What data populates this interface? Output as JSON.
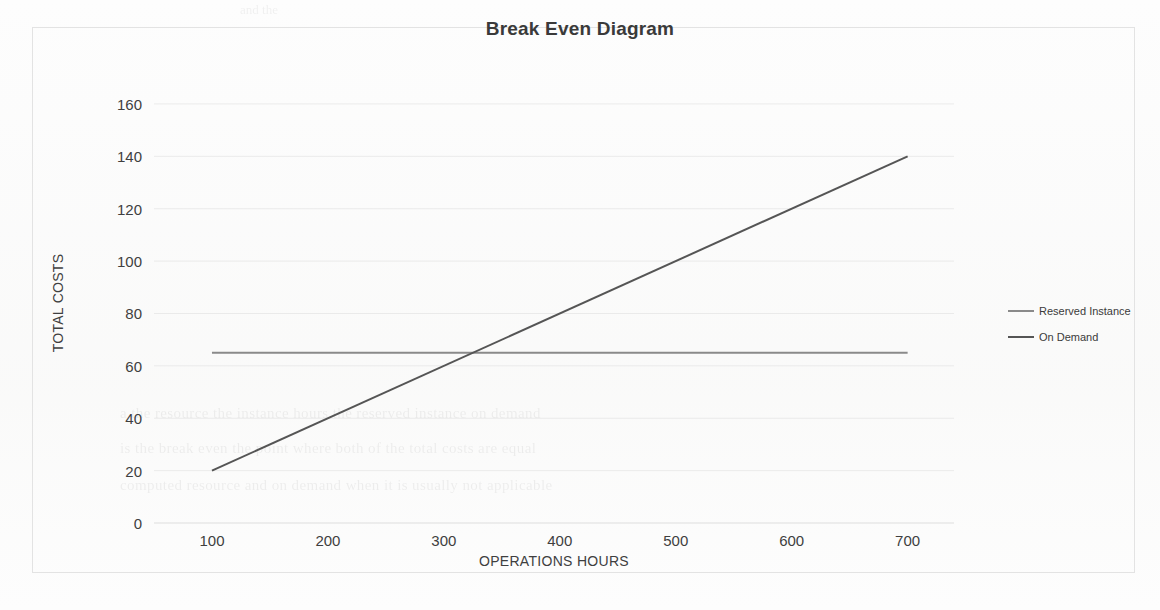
{
  "chart_data": {
    "type": "line",
    "title": "Break Even Diagram",
    "xlabel": "OPERATIONS HOURS",
    "ylabel": "TOTAL COSTS",
    "xlim": [
      50,
      740
    ],
    "ylim": [
      0,
      168
    ],
    "xticks": [
      100,
      200,
      300,
      400,
      500,
      600,
      700
    ],
    "yticks": [
      0,
      20,
      40,
      60,
      80,
      100,
      120,
      140,
      160
    ],
    "grid": true,
    "legend_position": "right",
    "series": [
      {
        "name": "Reserved Instance",
        "color": "#8a8a8a",
        "x": [
          100,
          700
        ],
        "values": [
          65,
          65
        ]
      },
      {
        "name": "On Demand",
        "color": "#555555",
        "x": [
          100,
          700
        ],
        "values": [
          20,
          140
        ]
      }
    ],
    "break_even_point": {
      "x": 325,
      "y": 65
    }
  },
  "legend": {
    "items": [
      {
        "label": "Reserved Instance"
      },
      {
        "label": "On Demand"
      }
    ]
  },
  "scan_artifacts": {
    "ghost_lines": [
      "a the resource the instance hours the reserved instance on demand",
      "is the break even the point where both of the total costs are equal",
      "computed resource and on demand when it is usually not applicable"
    ],
    "ghost_top": "and the"
  }
}
